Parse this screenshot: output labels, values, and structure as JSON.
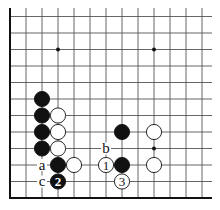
{
  "diagram": {
    "type": "go-board-fragment",
    "colors": {
      "background": "#ffffff",
      "line": "#555555",
      "edge": "#111111",
      "black": "#111111",
      "white": "#ffffff"
    },
    "grid": {
      "origin_x": 10,
      "origin_y": 16.5,
      "spacing_x": 16,
      "spacing_y": 16.5,
      "cols": 13,
      "rows": 12,
      "top_extent": 8,
      "right_extent": 212,
      "left_edge": true,
      "bottom_edge": true
    },
    "hoshi": [
      {
        "col": 3,
        "row": 2
      },
      {
        "col": 9,
        "row": 2
      },
      {
        "col": 9,
        "row": 8
      }
    ],
    "stones": [
      {
        "color": "black",
        "col": 2,
        "row": 5,
        "label": ""
      },
      {
        "color": "black",
        "col": 2,
        "row": 6,
        "label": ""
      },
      {
        "color": "black",
        "col": 2,
        "row": 7,
        "label": ""
      },
      {
        "color": "black",
        "col": 2,
        "row": 8,
        "label": ""
      },
      {
        "color": "white",
        "col": 3,
        "row": 6,
        "label": ""
      },
      {
        "color": "white",
        "col": 3,
        "row": 7,
        "label": ""
      },
      {
        "color": "white",
        "col": 3,
        "row": 8,
        "label": ""
      },
      {
        "color": "black",
        "col": 3,
        "row": 9,
        "label": ""
      },
      {
        "color": "white",
        "col": 4,
        "row": 9,
        "label": ""
      },
      {
        "color": "white",
        "col": 6,
        "row": 9,
        "label": "1"
      },
      {
        "color": "black",
        "col": 7,
        "row": 9,
        "label": ""
      },
      {
        "color": "black",
        "col": 7,
        "row": 7,
        "label": ""
      },
      {
        "color": "white",
        "col": 9,
        "row": 7,
        "label": ""
      },
      {
        "color": "white",
        "col": 9,
        "row": 9,
        "label": ""
      },
      {
        "color": "black",
        "col": 3,
        "row": 10,
        "label": "2"
      },
      {
        "color": "white",
        "col": 7,
        "row": 10,
        "label": "3"
      }
    ],
    "letters": [
      {
        "text": "a",
        "col": 2,
        "row": 9
      },
      {
        "text": "b",
        "col": 6,
        "row": 8
      },
      {
        "text": "c",
        "col": 2,
        "row": 10
      }
    ]
  }
}
